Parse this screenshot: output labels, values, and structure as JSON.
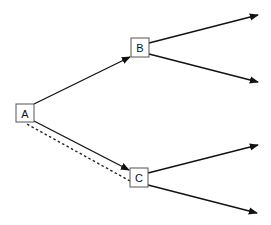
{
  "diagram": {
    "type": "decision-tree",
    "nodes": [
      {
        "id": "A",
        "label": "A"
      },
      {
        "id": "B",
        "label": "B"
      },
      {
        "id": "C",
        "label": "C"
      }
    ],
    "edges": [
      {
        "from": "A",
        "to": "B",
        "style": "solid",
        "arrow": true
      },
      {
        "from": "A",
        "to": "C",
        "style": "solid",
        "arrow": true
      },
      {
        "from": "C",
        "to": "A",
        "style": "dashed",
        "arrow": false
      },
      {
        "from": "B",
        "to": "out-1",
        "style": "solid",
        "arrow": true
      },
      {
        "from": "B",
        "to": "out-2",
        "style": "solid",
        "arrow": true
      },
      {
        "from": "C",
        "to": "out-3",
        "style": "solid",
        "arrow": true
      },
      {
        "from": "C",
        "to": "out-4",
        "style": "solid",
        "arrow": true
      }
    ],
    "colors": {
      "line": "#111111",
      "box_border": "#555555",
      "background": "#ffffff"
    }
  }
}
